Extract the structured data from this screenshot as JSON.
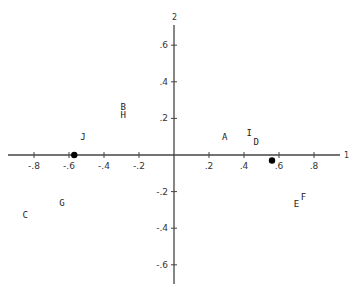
{
  "chart_data": {
    "type": "scatter",
    "title": "",
    "xlabel": "",
    "ylabel": "",
    "x_axis_end_label": "1",
    "y_axis_end_label": "2",
    "xlim": [
      -0.9,
      0.95
    ],
    "ylim": [
      -0.72,
      0.72
    ],
    "grid": false,
    "legend": null,
    "x_ticks": [
      {
        "value": -0.8,
        "label": "-.8"
      },
      {
        "value": -0.6,
        "label": "-.6"
      },
      {
        "value": -0.4,
        "label": "-.4"
      },
      {
        "value": -0.2,
        "label": "-.2"
      },
      {
        "value": 0.2,
        "label": ".2"
      },
      {
        "value": 0.4,
        "label": ".4"
      },
      {
        "value": 0.6,
        "label": ".6"
      },
      {
        "value": 0.8,
        "label": ".8"
      }
    ],
    "y_ticks": [
      {
        "value": 0.6,
        "label": ".6"
      },
      {
        "value": 0.4,
        "label": ".4"
      },
      {
        "value": 0.2,
        "label": ".2"
      },
      {
        "value": -0.2,
        "label": "-.2"
      },
      {
        "value": -0.4,
        "label": "-.4"
      },
      {
        "value": -0.6,
        "label": "-.6"
      }
    ],
    "labeled_points": [
      {
        "label": "A",
        "x": 0.29,
        "y": 0.1
      },
      {
        "label": "B",
        "x": -0.29,
        "y": 0.26
      },
      {
        "label": "C",
        "x": -0.85,
        "y": -0.33
      },
      {
        "label": "D",
        "x": 0.47,
        "y": 0.07
      },
      {
        "label": "E",
        "x": 0.7,
        "y": -0.27
      },
      {
        "label": "F",
        "x": 0.74,
        "y": -0.23
      },
      {
        "label": "G",
        "x": -0.64,
        "y": -0.26
      },
      {
        "label": "H",
        "x": -0.29,
        "y": 0.22
      },
      {
        "label": "I",
        "x": 0.43,
        "y": 0.12
      },
      {
        "label": "J",
        "x": -0.52,
        "y": 0.1
      }
    ],
    "marker_points": [
      {
        "x": -0.57,
        "y": 0.0
      },
      {
        "x": 0.56,
        "y": -0.03
      }
    ]
  },
  "layout": {
    "origin_px": [
      174,
      155
    ],
    "x_scale_px_per_unit": 175,
    "y_scale_px_per_unit": 183,
    "x_axis_px": [
      8,
      340
    ],
    "y_axis_px": [
      25,
      284
    ],
    "axis_color": "#444444",
    "marker_color": "#000000"
  }
}
